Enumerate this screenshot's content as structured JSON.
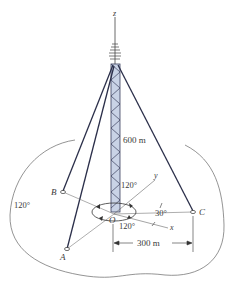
{
  "figure": {
    "axes": {
      "z": "z",
      "y": "y",
      "x": "x",
      "origin": "O"
    },
    "anchors": {
      "a": "A",
      "b": "B",
      "c": "C"
    },
    "dimensions": {
      "tower_height": "600 m",
      "anchor_radius": "300 m"
    },
    "angles": {
      "angle_yO_tower": "120°",
      "angle_left": "120°",
      "angle_bottom": "120°",
      "angle_x_c": "30°"
    },
    "colors": {
      "guy_wire": "#2b2f4a",
      "tower_fill": "#c9d3e6",
      "tower_lattice": "#3b3f5c",
      "ground_outline": "#555555",
      "text": "#3a3a3a"
    }
  }
}
